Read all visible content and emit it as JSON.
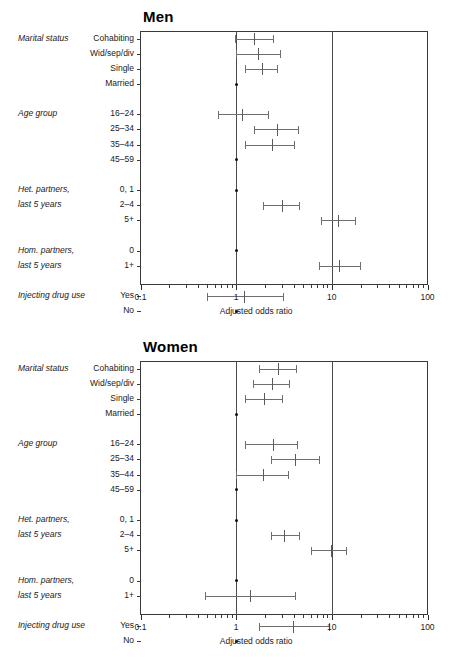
{
  "figure": {
    "background": "#ffffff",
    "line_color": "#6f6f6f",
    "frame_color": "#3a3a3a"
  },
  "chart_data": {
    "type": "scatter",
    "subtype": "forest-plot",
    "xlabel": "Adjusted odds ratio",
    "ylabel": "",
    "xscale": "log",
    "xlim": [
      0.1,
      100
    ],
    "xticks": [
      0.1,
      1,
      10,
      100
    ],
    "xtick_labels": [
      "0.1",
      "1",
      "10",
      "100"
    ],
    "grid": false,
    "legend": "none",
    "reference_lines": [
      1,
      10
    ],
    "panels": [
      {
        "name": "men",
        "title": "Men",
        "groups": [
          {
            "group_label": "Marital status",
            "rows": [
              {
                "label": "Cohabiting",
                "or": 1.55,
                "lo": 0.97,
                "hi": 2.45,
                "reference": false
              },
              {
                "label": "Wid/sep/div",
                "or": 1.7,
                "lo": 1.0,
                "hi": 2.85,
                "reference": false
              },
              {
                "label": "Single",
                "or": 1.85,
                "lo": 1.25,
                "hi": 2.7,
                "reference": false
              },
              {
                "label": "Married",
                "or": 1.0,
                "lo": null,
                "hi": null,
                "reference": true
              }
            ]
          },
          {
            "group_label": "Age group",
            "rows": [
              {
                "label": "16–24",
                "or": 1.15,
                "lo": 0.65,
                "hi": 2.15,
                "reference": false
              },
              {
                "label": "25–34",
                "or": 2.65,
                "lo": 1.55,
                "hi": 4.45,
                "reference": false
              },
              {
                "label": "35–44",
                "or": 2.35,
                "lo": 1.25,
                "hi": 4.05,
                "reference": false
              },
              {
                "label": "45–59",
                "or": 1.0,
                "lo": null,
                "hi": null,
                "reference": true
              }
            ]
          },
          {
            "group_label": "Het. partners,\nlast 5 years",
            "group_label_line1": "Het. partners,",
            "group_label_line2": "last 5 years",
            "rows": [
              {
                "label": "0, 1",
                "or": 1.0,
                "lo": null,
                "hi": null,
                "reference": true
              },
              {
                "label": "2–4",
                "or": 3.0,
                "lo": 1.9,
                "hi": 4.55,
                "reference": false
              },
              {
                "label": "5+",
                "or": 11.5,
                "lo": 7.7,
                "hi": 17.5,
                "reference": false
              }
            ]
          },
          {
            "group_label": "Hom. partners,\nlast 5 years",
            "group_label_line1": "Hom. partners,",
            "group_label_line2": "last 5 years",
            "rows": [
              {
                "label": "0",
                "or": 1.0,
                "lo": null,
                "hi": null,
                "reference": true
              },
              {
                "label": "1+",
                "or": 11.8,
                "lo": 7.4,
                "hi": 19.5,
                "reference": false
              }
            ]
          },
          {
            "group_label": "Injecting drug use",
            "rows": [
              {
                "label": "Yes",
                "or": 1.2,
                "lo": 0.5,
                "hi": 3.1,
                "reference": false
              },
              {
                "label": "No",
                "or": 1.0,
                "lo": null,
                "hi": null,
                "reference": true
              }
            ]
          }
        ]
      },
      {
        "name": "women",
        "title": "Women",
        "groups": [
          {
            "group_label": "Marital status",
            "rows": [
              {
                "label": "Cohabiting",
                "or": 2.75,
                "lo": 1.75,
                "hi": 4.2,
                "reference": false
              },
              {
                "label": "Wid/sep/div",
                "or": 2.35,
                "lo": 1.5,
                "hi": 3.6,
                "reference": false
              },
              {
                "label": "Single",
                "or": 1.95,
                "lo": 1.25,
                "hi": 3.0,
                "reference": false
              },
              {
                "label": "Married",
                "or": 1.0,
                "lo": null,
                "hi": null,
                "reference": true
              }
            ]
          },
          {
            "group_label": "Age group",
            "rows": [
              {
                "label": "16–24",
                "or": 2.45,
                "lo": 1.25,
                "hi": 4.3,
                "reference": false
              },
              {
                "label": "25–34",
                "or": 4.1,
                "lo": 2.3,
                "hi": 7.4,
                "reference": false
              },
              {
                "label": "35–44",
                "or": 1.9,
                "lo": 1.0,
                "hi": 3.45,
                "reference": false
              },
              {
                "label": "45–59",
                "or": 1.0,
                "lo": null,
                "hi": null,
                "reference": true
              }
            ]
          },
          {
            "group_label": "Het. partners,\nlast 5 years",
            "group_label_line1": "Het. partners,",
            "group_label_line2": "last 5 years",
            "rows": [
              {
                "label": "0, 1",
                "or": 1.0,
                "lo": null,
                "hi": null,
                "reference": true
              },
              {
                "label": "2–4",
                "or": 3.2,
                "lo": 2.3,
                "hi": 4.5,
                "reference": false
              },
              {
                "label": "5+",
                "or": 9.8,
                "lo": 6.1,
                "hi": 14.0,
                "reference": false
              }
            ]
          },
          {
            "group_label": "Hom. partners,\nlast 5 years",
            "group_label_line1": "Hom. partners,",
            "group_label_line2": "last 5 years",
            "rows": [
              {
                "label": "0",
                "or": 1.0,
                "lo": null,
                "hi": null,
                "reference": true
              },
              {
                "label": "1+",
                "or": 1.4,
                "lo": 0.47,
                "hi": 4.1,
                "reference": false
              }
            ]
          },
          {
            "group_label": "Injecting drug use",
            "rows": [
              {
                "label": "Yes",
                "or": 3.9,
                "lo": 1.75,
                "hi": 9.3,
                "reference": false
              },
              {
                "label": "No",
                "or": 1.0,
                "lo": null,
                "hi": null,
                "reference": true
              }
            ]
          }
        ]
      }
    ]
  }
}
